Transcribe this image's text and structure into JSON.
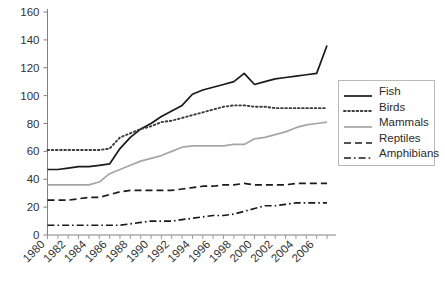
{
  "chart_data": {
    "type": "line",
    "title": "",
    "xlabel": "",
    "ylabel": "",
    "ylim": [
      0,
      160
    ],
    "ytick_step": 20,
    "yticks": [
      "0",
      "20",
      "40",
      "60",
      "80",
      "100",
      "120",
      "140",
      "160"
    ],
    "xlim": [
      1980,
      2007
    ],
    "xticks": [
      "1980",
      "1982",
      "1984",
      "1986",
      "1988",
      "1990",
      "1992",
      "1994",
      "1996",
      "1998",
      "2000",
      "2002",
      "2004",
      "2006"
    ],
    "x": [
      1980,
      1981,
      1982,
      1983,
      1984,
      1985,
      1986,
      1987,
      1988,
      1989,
      1990,
      1991,
      1992,
      1993,
      1994,
      1995,
      1996,
      1997,
      1998,
      1999,
      2000,
      2001,
      2002,
      2003,
      2004,
      2005,
      2006,
      2007
    ],
    "grid": false,
    "legend_position": "right",
    "series": [
      {
        "name": "Fish",
        "style": "solid",
        "color": "#1a1a1a",
        "values": [
          47,
          47,
          48,
          49,
          49,
          50,
          51,
          62,
          70,
          76,
          80,
          85,
          89,
          93,
          101,
          104,
          106,
          108,
          110,
          116,
          108,
          110,
          112,
          113,
          114,
          115,
          116,
          136
        ]
      },
      {
        "name": "Birds",
        "style": "dotted",
        "color": "#3b3b3b",
        "values": [
          61,
          61,
          61,
          61,
          61,
          61,
          62,
          70,
          73,
          76,
          78,
          81,
          82,
          84,
          86,
          88,
          90,
          92,
          93,
          93,
          92,
          92,
          91,
          91,
          91,
          91,
          91,
          91
        ]
      },
      {
        "name": "Mammals",
        "style": "solid",
        "color": "#a6a6a6",
        "values": [
          36,
          36,
          36,
          36,
          36,
          38,
          44,
          47,
          50,
          53,
          55,
          57,
          60,
          63,
          64,
          64,
          64,
          64,
          65,
          65,
          69,
          70,
          72,
          74,
          77,
          79,
          80,
          81
        ]
      },
      {
        "name": "Reptiles",
        "style": "dashed",
        "color": "#1a1a1a",
        "values": [
          25,
          25,
          25,
          26,
          27,
          27,
          29,
          31,
          32,
          32,
          32,
          32,
          32,
          33,
          34,
          35,
          35,
          36,
          36,
          37,
          36,
          36,
          36,
          36,
          37,
          37,
          37,
          37
        ]
      },
      {
        "name": "Amphibians",
        "style": "dashdot",
        "color": "#1a1a1a",
        "values": [
          7,
          7,
          7,
          7,
          7,
          7,
          7,
          7,
          8,
          9,
          10,
          10,
          10,
          11,
          12,
          13,
          14,
          14,
          15,
          17,
          19,
          21,
          21,
          22,
          23,
          23,
          23,
          23
        ]
      }
    ]
  },
  "legend": {
    "items": [
      {
        "label": "Fish"
      },
      {
        "label": "Birds"
      },
      {
        "label": "Mammals"
      },
      {
        "label": "Reptiles"
      },
      {
        "label": "Amphibians"
      }
    ]
  }
}
